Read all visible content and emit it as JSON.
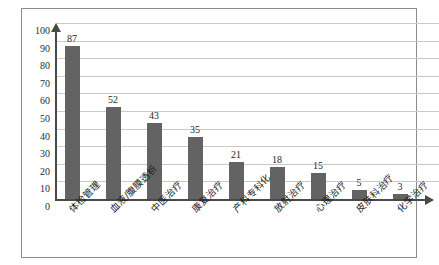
{
  "chart_data": {
    "type": "bar",
    "title": "",
    "subtitle": "",
    "xlabel": "",
    "ylabel": "",
    "ylim": [
      0,
      100
    ],
    "ytick_step": 10,
    "yticks": [
      "100",
      "90",
      "80",
      "70",
      "60",
      "50",
      "40",
      "30",
      "20",
      "10",
      "0"
    ],
    "grid": true,
    "legend": false,
    "legend_position": "none",
    "orientation": "vertical",
    "categories": [
      "体检管理",
      "血液/腹膜透析",
      "中医治疗",
      "康复治疗",
      "产科专科化",
      "放射治疗",
      "心理治疗",
      "皮肤科治疗",
      "化学治疗"
    ],
    "values": [
      87,
      52,
      43,
      35,
      21,
      18,
      15,
      5,
      3
    ],
    "data_labels": [
      "87",
      "52",
      "43",
      "35",
      "21",
      "18",
      "15",
      "5",
      "3"
    ],
    "colors": {
      "bar": "#636363",
      "axis": "#4a4a4a",
      "gridline": "#c9c9c9",
      "frame": "#8c8c8c",
      "text": "#1f1f1f",
      "background": "#ffffff"
    }
  }
}
